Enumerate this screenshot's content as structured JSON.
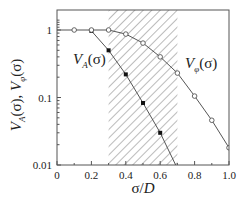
{
  "chart_data": {
    "type": "line",
    "title": "",
    "xlabel": "σ/D",
    "ylabel": "V_A(σ),  V_φ(σ)",
    "xscale": "linear",
    "yscale": "log",
    "xlim": [
      0,
      1.0
    ],
    "ylim": [
      0.01,
      1.5
    ],
    "x_ticks": [
      "0",
      "0.2",
      "0.4",
      "0.6",
      "0.8",
      "1.0"
    ],
    "y_ticks": [
      "0.01",
      "0.1",
      "1"
    ],
    "grid": false,
    "shaded_region": {
      "x_start": 0.3,
      "x_end": 0.7,
      "pattern": "diagonal-hatch"
    },
    "series": [
      {
        "name": "V_A(σ)",
        "label_main": "V",
        "label_sub": "A",
        "label_arg": "(σ)",
        "marker": "filled-square",
        "x": [
          0.2,
          0.3,
          0.4,
          0.5,
          0.6,
          0.69
        ],
        "values": [
          0.97,
          0.5,
          0.22,
          0.083,
          0.03,
          0.01
        ],
        "marker_points": [
          0.2,
          0.3,
          0.4,
          0.5,
          0.6
        ]
      },
      {
        "name": "V_φ(σ)",
        "label_main": "V",
        "label_sub": "φ",
        "label_arg": "(σ)",
        "marker": "open-circle",
        "x": [
          0,
          0.1,
          0.2,
          0.3,
          0.4,
          0.5,
          0.6,
          0.7,
          0.8,
          0.9,
          1.0
        ],
        "values": [
          1.0,
          1.0,
          1.0,
          1.0,
          0.87,
          0.64,
          0.4,
          0.23,
          0.105,
          0.046,
          0.018
        ],
        "marker_points": [
          0.1,
          0.2,
          0.3,
          0.4,
          0.5,
          0.6,
          0.7,
          0.8,
          0.9,
          1.0
        ]
      }
    ],
    "legend": "inline labels"
  },
  "colors": {
    "axis": "#555555",
    "line": "#555555",
    "hatch": "#777777",
    "marker_fill": "#111111"
  }
}
